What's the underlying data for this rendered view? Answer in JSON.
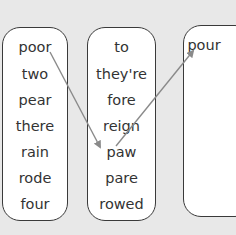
{
  "columns": [
    {
      "words": [
        "poor",
        "two",
        "pear",
        "there",
        "rain",
        "rode",
        "four"
      ]
    },
    {
      "words": [
        "to",
        "they're",
        "fore",
        "reign",
        "paw",
        "pare",
        "rowed"
      ]
    },
    {
      "words": [
        "pour"
      ]
    }
  ],
  "arrows": [
    {
      "from": "poor",
      "to": "paw"
    },
    {
      "from": "paw",
      "to": "pour"
    }
  ],
  "colors": {
    "background": "#e8e8e8",
    "box": "#ffffff",
    "border": "#3a3a3a",
    "arrow": "#8a8a8a",
    "text": "#333333"
  }
}
